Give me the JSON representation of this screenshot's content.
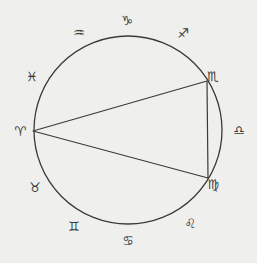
{
  "diagram": {
    "type": "zodiac-circle-with-triangle",
    "colors": {
      "background": "#efefed",
      "stroke": "#3a3a3a"
    },
    "circle": {
      "cx": 128,
      "cy": 130,
      "r": 94
    },
    "triangle": [
      {
        "name": "aries-point",
        "x": 33,
        "y": 131
      },
      {
        "name": "scorpio-point",
        "x": 207,
        "y": 81
      },
      {
        "name": "virgo-point",
        "x": 208,
        "y": 178
      }
    ],
    "signs": [
      {
        "name": "capricorn",
        "glyph": "♑",
        "label": "VS",
        "x": 127,
        "y": 20
      },
      {
        "name": "sagittarius",
        "glyph": "♐",
        "x": 183,
        "y": 33
      },
      {
        "name": "scorpio",
        "glyph": "♏",
        "x": 213,
        "y": 76
      },
      {
        "name": "libra",
        "glyph": "♎",
        "x": 239,
        "y": 130
      },
      {
        "name": "virgo",
        "glyph": "♍",
        "x": 213,
        "y": 184
      },
      {
        "name": "leo",
        "glyph": "♌",
        "x": 190,
        "y": 223
      },
      {
        "name": "cancer",
        "glyph": "♋",
        "x": 128,
        "y": 240
      },
      {
        "name": "gemini",
        "glyph": "♊",
        "x": 74,
        "y": 226
      },
      {
        "name": "taurus",
        "glyph": "♉",
        "x": 35,
        "y": 187
      },
      {
        "name": "aries",
        "glyph": "♈",
        "x": 20,
        "y": 131
      },
      {
        "name": "pisces",
        "glyph": "♓",
        "x": 32,
        "y": 76
      },
      {
        "name": "aquarius",
        "glyph": "♒",
        "x": 79,
        "y": 32
      }
    ]
  }
}
